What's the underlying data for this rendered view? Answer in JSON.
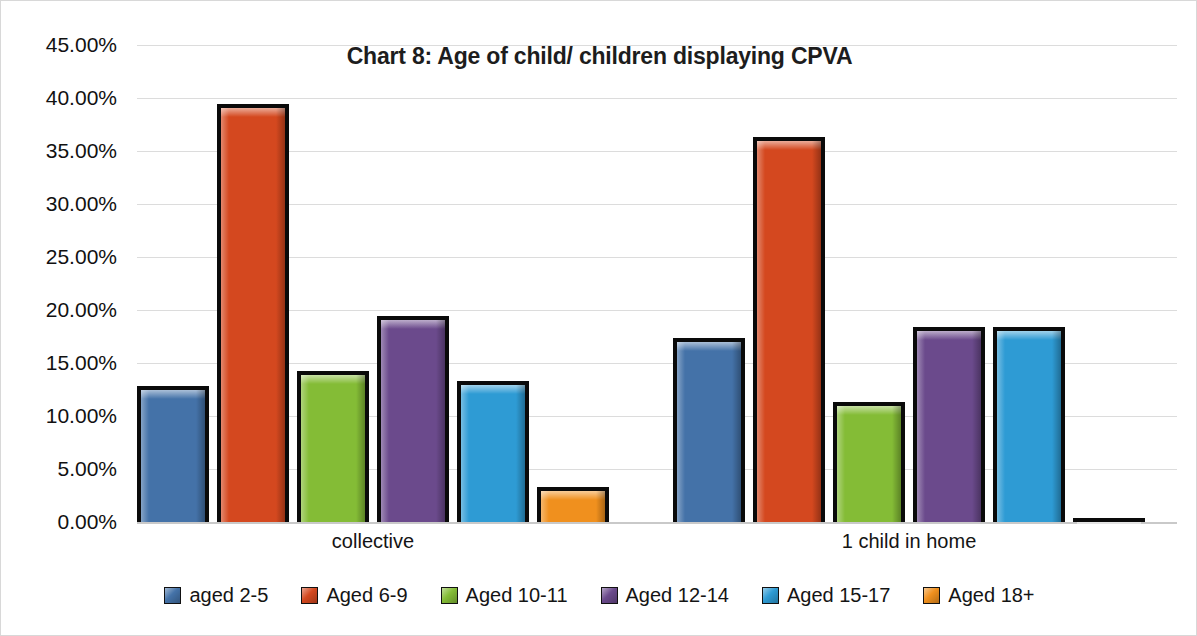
{
  "chart_data": {
    "type": "bar",
    "title": "Chart 8: Age of child/ children displaying CPVA",
    "xlabel": "",
    "ylabel": "",
    "categories": [
      "collective",
      "1 child in home"
    ],
    "ylim": [
      0,
      45
    ],
    "ytick_step": 5,
    "ytick_labels": [
      "45.00%",
      "40.00%",
      "35.00%",
      "30.00%",
      "25.00%",
      "20.00%",
      "15.00%",
      "10.00%",
      "5.00%",
      "0.00%"
    ],
    "ytick_values": [
      45,
      40,
      35,
      30,
      25,
      20,
      15,
      10,
      5,
      0
    ],
    "grid": true,
    "legend_position": "bottom",
    "series": [
      {
        "name": "aged 2-5",
        "color": "#4472a8",
        "values": [
          12.8,
          17.4
        ]
      },
      {
        "name": "Aged 6-9",
        "color": "#d4481f",
        "values": [
          39.4,
          36.3
        ]
      },
      {
        "name": "Aged 10-11",
        "color": "#84bc36",
        "values": [
          14.2,
          11.3
        ]
      },
      {
        "name": "Aged 12-14",
        "color": "#6b4a8c",
        "values": [
          19.4,
          18.4
        ]
      },
      {
        "name": "Aged 15-17",
        "color": "#2e9bd4",
        "values": [
          13.3,
          18.4
        ]
      },
      {
        "name": "Aged 18+",
        "color": "#f0901e",
        "values": [
          3.3,
          0.3
        ]
      }
    ]
  },
  "legend": {
    "items": [
      {
        "label": "aged 2-5",
        "color": "#4472a8"
      },
      {
        "label": "Aged 6-9",
        "color": "#d4481f"
      },
      {
        "label": "Aged 10-11",
        "color": "#84bc36"
      },
      {
        "label": "Aged 12-14",
        "color": "#6b4a8c"
      },
      {
        "label": "Aged 15-17",
        "color": "#2e9bd4"
      },
      {
        "label": "Aged 18+",
        "color": "#f0901e"
      }
    ]
  }
}
